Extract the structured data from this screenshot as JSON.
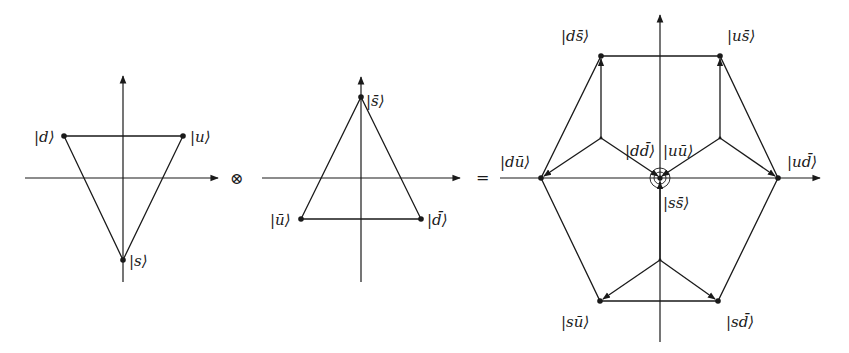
{
  "figure": {
    "operators": {
      "tensor": "⊗",
      "equals": "="
    },
    "triplet": {
      "labels": {
        "d": "|d⟩",
        "u": "|u⟩",
        "s": "|s⟩"
      }
    },
    "antitriplet": {
      "labels": {
        "sbar": "|s̄⟩",
        "ubar": "|ū⟩",
        "dbar": "|d̄⟩"
      }
    },
    "nonet": {
      "labels": {
        "ds": "|ds̄⟩",
        "us": "|us̄⟩",
        "du": "|dū⟩",
        "ud": "|ud̄⟩",
        "dd": "|dd̄⟩",
        "uu": "|uū⟩",
        "ss": "|ss̄⟩",
        "su": "|sū⟩",
        "sd": "|sd̄⟩"
      }
    }
  }
}
